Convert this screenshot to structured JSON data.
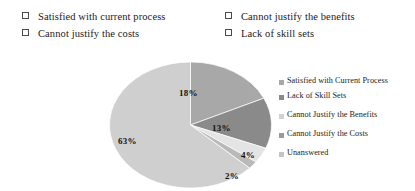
{
  "checklist": {
    "columns": [
      {
        "items": [
          {
            "label": "Satisfied with current process",
            "checked": false
          },
          {
            "label": "Cannot justify the costs",
            "checked": false
          }
        ]
      },
      {
        "items": [
          {
            "label": "Cannot justify the benefits",
            "checked": false
          },
          {
            "label": "Lack of skill sets",
            "checked": false
          }
        ]
      }
    ]
  },
  "chart_data": {
    "type": "pie",
    "title": "",
    "legend_position": "right",
    "start_angle_deg": 0,
    "direction": "clockwise",
    "categories": [
      "Satisfied with Current Process",
      "Lack of Skill Sets",
      "Cannot Justify the Benefits",
      "Cannot Justify the Costs",
      "Unanswered"
    ],
    "values": [
      18,
      13,
      4,
      2,
      63
    ],
    "labels": [
      "18%",
      "13%",
      "4%",
      "2%",
      "63%"
    ],
    "colors": [
      "#a8a8a8",
      "#8a8a8a",
      "#e0e0e0",
      "#b9b9b9",
      "#cfcfcf"
    ],
    "slices": [
      {
        "name": "Satisfied with Current Process",
        "value": 18,
        "label": "18%",
        "color": "#a8a8a8"
      },
      {
        "name": "Lack of Skill Sets",
        "value": 13,
        "label": "13%",
        "color": "#8a8a8a"
      },
      {
        "name": "Cannot Justify the Benefits",
        "value": 4,
        "label": "4%",
        "color": "#e4e4e4"
      },
      {
        "name": "Cannot Justify the Costs",
        "value": 2,
        "label": "2%",
        "color": "#b9b9b9"
      },
      {
        "name": "Unanswered",
        "value": 63,
        "label": "63%",
        "color": "#cfcfcf"
      }
    ]
  },
  "legend": {
    "items": [
      {
        "label": "Satisfied with Current Process",
        "color": "#a8a8a8"
      },
      {
        "label": "Lack of Skill Sets",
        "color": "#8a8a8a"
      },
      {
        "label": "Cannot Justify the Benefits",
        "color": "#d2d2d2"
      },
      {
        "label": "Cannot Justify the Costs",
        "color": "#9a9a9a"
      },
      {
        "label": "Unanswered",
        "color": "#c4c4c4"
      }
    ]
  },
  "pie_labels": {
    "l0": "18%",
    "l1": "13%",
    "l2": "4%",
    "l3": "2%",
    "l4": "63%"
  }
}
